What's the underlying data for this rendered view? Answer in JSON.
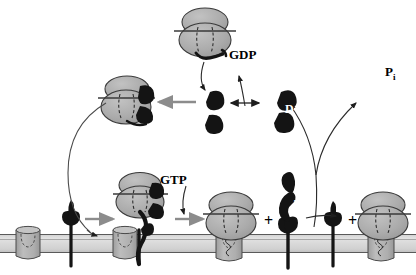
{
  "figure": {
    "type": "diagram",
    "background_color": "#ffffff",
    "width": 416,
    "height": 275
  },
  "palette": {
    "blob_fill": "#a8a8a8",
    "blob_fill_light": "#b8b8b8",
    "blob_stroke": "#3a3a3a",
    "dark_subunit": "#141414",
    "membrane_fill": "#d6d6d6",
    "membrane_stroke": "#555555",
    "receptor_fill": "#b0b0b0",
    "receptor_stroke": "#4a4a4a",
    "arrow_gray": "#8c8c8c",
    "arrow_dark": "#2b2b2b",
    "label_color": "#000000"
  },
  "labels": {
    "gdp": "GDP",
    "gtp": "GTP",
    "pi": "P",
    "pi_subscript": "i",
    "d_subunit": "D",
    "t_subunit": "T",
    "plus_1": "+",
    "plus_2": "+"
  },
  "elements": {
    "membrane": {
      "name": "plasma-membrane",
      "y_top": 233,
      "y_bottom": 253
    },
    "receptors": [
      {
        "name": "receptor-unbound-left",
        "x": 28,
        "state": "inactive"
      },
      {
        "name": "receptor-bound-mid-left",
        "x": 125,
        "state": "g-protein-docked"
      },
      {
        "name": "receptor-bound-center",
        "x": 228,
        "state": "alpha-released"
      },
      {
        "name": "receptor-bound-right",
        "x": 380,
        "state": "reassembled"
      }
    ],
    "complexes": [
      {
        "name": "trimer-top-center",
        "x": 205,
        "y": 30,
        "state": "gdp-bound-inactive"
      },
      {
        "name": "trimer-upper-left",
        "x": 128,
        "y": 100,
        "state": "beta-gamma-rebinding"
      },
      {
        "name": "trimer-lower-left",
        "x": 143,
        "y": 196,
        "state": "receptor-engaged"
      },
      {
        "name": "trimer-center-bottom",
        "x": 233,
        "y": 218,
        "state": "membrane-bound"
      },
      {
        "name": "trimer-right-bottom",
        "x": 383,
        "y": 218,
        "state": "reformed-heterotrimer"
      }
    ],
    "free_subunits": [
      {
        "name": "alpha-free-center",
        "x": 211,
        "y": 110,
        "label": ""
      },
      {
        "name": "alpha-gdp-right",
        "x": 283,
        "y": 110,
        "label": "D"
      },
      {
        "name": "alpha-gtp-bottom",
        "x": 288,
        "y": 215,
        "label": "T"
      }
    ],
    "arrows": [
      {
        "name": "arrow-recycle-left",
        "type": "curved-long",
        "from": "upper-left-trimer",
        "to": "membrane-receptor"
      },
      {
        "name": "arrow-gdp-release",
        "type": "curved",
        "label": "GDP"
      },
      {
        "name": "arrow-equilibrium-left",
        "type": "double-headed"
      },
      {
        "name": "arrow-equilibrium-right",
        "type": "double-headed"
      },
      {
        "name": "arrow-betagamma-rebind",
        "type": "straight-gray"
      },
      {
        "name": "arrow-gtp-binding",
        "type": "curved",
        "label": "GTP"
      },
      {
        "name": "arrow-pi-release",
        "type": "curved-branch",
        "label": "Pi"
      },
      {
        "name": "arrow-activation-1",
        "type": "straight-gray"
      },
      {
        "name": "arrow-activation-2",
        "type": "straight-gray"
      },
      {
        "name": "arrow-reassociation",
        "type": "thin-dark"
      }
    ]
  }
}
